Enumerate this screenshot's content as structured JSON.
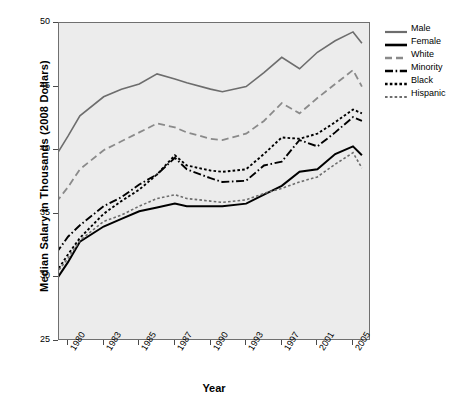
{
  "chart_data": {
    "type": "line",
    "title": "",
    "xlabel": "Year",
    "ylabel": "Median Salary in Thousands (2008 Dollars)",
    "grid": false,
    "legend_position": "right",
    "ylim": [
      25,
      50
    ],
    "yticks": [
      25,
      30,
      35,
      40,
      45,
      50
    ],
    "ytick_labels": [
      "25",
      "30",
      "35",
      "40",
      "45",
      "50"
    ],
    "xticks": [
      1980,
      1983,
      1985,
      1987,
      1990,
      1993,
      1997,
      2001,
      2005
    ],
    "xtick_labels": [
      "1980",
      "1983",
      "1985",
      "1987",
      "1990",
      "1993",
      "1997",
      "2001",
      "2005"
    ],
    "x": [
      1979,
      1980,
      1981,
      1983,
      1984,
      1985,
      1986,
      1987,
      1988,
      1990,
      1991,
      1993,
      1995,
      1997,
      1999,
      2001,
      2003,
      2005,
      2006
    ],
    "series": [
      {
        "name": "Male",
        "color": "#6d6d6d",
        "style": "solid",
        "width": 1.6,
        "values": [
          39.6,
          41.1,
          42.7,
          44.2,
          44.8,
          45.2,
          46.0,
          45.6,
          45.3,
          44.8,
          44.6,
          45.0,
          46.1,
          47.3,
          46.4,
          47.7,
          48.6,
          49.3,
          48.4
        ]
      },
      {
        "name": "Female",
        "color": "#000000",
        "style": "solid",
        "width": 2.0,
        "values": [
          29.8,
          31.2,
          32.8,
          34.0,
          34.6,
          35.2,
          35.5,
          35.8,
          35.6,
          35.6,
          35.6,
          35.8,
          36.5,
          37.2,
          38.3,
          38.5,
          39.7,
          40.3,
          39.6
        ]
      },
      {
        "name": "White",
        "color": "#8a8a8a",
        "style": "dashed",
        "width": 1.8,
        "values": [
          35.9,
          37.1,
          38.5,
          40.0,
          40.7,
          41.4,
          42.1,
          41.8,
          41.4,
          40.9,
          40.8,
          41.3,
          42.3,
          43.7,
          42.9,
          44.1,
          45.2,
          46.3,
          45.0
        ]
      },
      {
        "name": "Minority",
        "color": "#000000",
        "style": "dashdot",
        "width": 1.9,
        "values": [
          31.9,
          33.2,
          34.1,
          35.6,
          36.3,
          37.3,
          38.1,
          39.4,
          38.5,
          37.8,
          37.5,
          37.6,
          38.8,
          39.1,
          40.8,
          40.3,
          41.4,
          42.6,
          42.3
        ]
      },
      {
        "name": "Black",
        "color": "#000000",
        "style": "dotted",
        "width": 1.9,
        "values": [
          30.4,
          31.8,
          33.1,
          35.0,
          36.0,
          36.9,
          38.1,
          39.6,
          38.8,
          38.4,
          38.3,
          38.5,
          39.7,
          41.0,
          40.9,
          41.3,
          42.2,
          43.2,
          42.9
        ]
      },
      {
        "name": "Hispanic",
        "color": "#6d6d6d",
        "style": "dotted",
        "width": 1.6,
        "values": [
          30.3,
          31.5,
          32.9,
          34.4,
          34.9,
          35.6,
          36.2,
          36.5,
          36.2,
          36.0,
          35.9,
          36.1,
          36.6,
          37.0,
          37.5,
          37.9,
          38.9,
          39.8,
          38.6
        ]
      }
    ]
  },
  "legend": {
    "items": [
      {
        "label": "Male"
      },
      {
        "label": "Female"
      },
      {
        "label": "White"
      },
      {
        "label": "Minority"
      },
      {
        "label": "Black"
      },
      {
        "label": "Hispanic"
      }
    ]
  }
}
